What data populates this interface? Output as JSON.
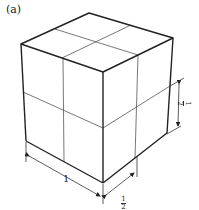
{
  "figure": {
    "panel_label": "(a)",
    "dimensions": {
      "front_left_edge": "1",
      "front_right_edge": {
        "numerator": "1",
        "denominator": "2"
      },
      "right_vertical": {
        "numerator": "1",
        "denominator": "2"
      }
    },
    "colors": {
      "outline": "#222222",
      "inner_lines": "#555555",
      "background": "#ffffff"
    }
  }
}
